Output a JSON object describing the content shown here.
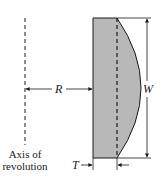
{
  "diagram": {
    "labels": {
      "radius": "R",
      "width": "W",
      "thickness": "T",
      "axis_line1": "Axis of",
      "axis_line2": "revolution"
    },
    "colors": {
      "fill": "#b8b8b8",
      "stroke": "#1a1a1a",
      "background": "#ffffff"
    }
  }
}
